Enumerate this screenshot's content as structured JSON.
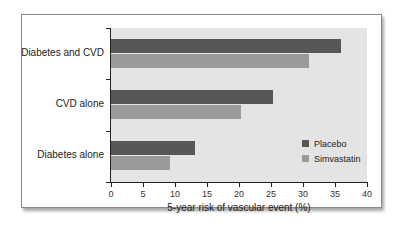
{
  "chart_data": {
    "type": "bar",
    "orientation": "horizontal",
    "title": "",
    "categories": [
      "Diabetes and CVD",
      "CVD alone",
      "Diabetes alone"
    ],
    "series": [
      {
        "name": "Placebo",
        "color": "#575757",
        "values": [
          36,
          25.3,
          13.2
        ]
      },
      {
        "name": "Simvastatin",
        "color": "#9a9a9a",
        "values": [
          31,
          20.3,
          9.2
        ]
      }
    ],
    "xlabel": "5-year risk of vascular event (%)",
    "ylabel": "",
    "xlim": [
      0,
      40
    ],
    "xticks": [
      "0",
      "5",
      "10",
      "15",
      "20",
      "25",
      "30",
      "35",
      "40"
    ],
    "grid": false,
    "legend_position": "lower right inside"
  },
  "colors": {
    "plot_background": "#e4e4e4",
    "placebo": "#575757",
    "simvastatin": "#9a9a9a"
  }
}
